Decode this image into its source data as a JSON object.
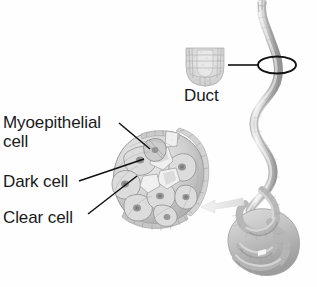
{
  "figure": {
    "background_color": "#fefefe",
    "width": 317,
    "height": 287
  },
  "labels": {
    "myoepithelial_cell": "Myoepithelial\ncell",
    "dark_cell": "Dark cell",
    "clear_cell": "Clear cell",
    "duct": "Duct"
  },
  "colors": {
    "text": "#1a1a1a",
    "leader_line": "#111111",
    "tissue_light": "#e3e3e3",
    "tissue_mid": "#c2c2c2",
    "tissue_dark": "#9a9a9a",
    "tissue_shadow": "#7d7d7d",
    "outline": "#8a8a8a"
  },
  "structures": {
    "duct_cross_section": "duct-cross-section-inset",
    "duct_tube": "wavy-duct-tube",
    "duct_marker_ellipse": "duct-location-ellipse",
    "secretory_coil": "coiled-secretory-portion",
    "magnified_sphere": "magnified-secretory-unit-cutaway",
    "magnify_arrow": "magnification-arrow"
  },
  "leader_lines": [
    {
      "name": "myoepithelial",
      "from": [
        120,
        124
      ],
      "to": [
        150,
        149
      ]
    },
    {
      "name": "dark-cell",
      "from": [
        80,
        181
      ],
      "to": [
        143,
        159
      ]
    },
    {
      "name": "clear-cell",
      "from": [
        88,
        213
      ],
      "to": [
        137,
        176
      ]
    },
    {
      "name": "duct",
      "from": [
        228,
        65
      ],
      "to": [
        268,
        65
      ]
    }
  ]
}
